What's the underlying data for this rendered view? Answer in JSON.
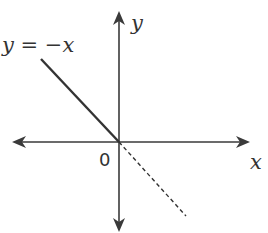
{
  "diagram": {
    "function_label": "y = −x",
    "y_axis_label": "y",
    "x_axis_label": "x",
    "origin_label": "0",
    "colors": {
      "axis": "#3a3a3a",
      "line": "#333333",
      "text": "#333333"
    }
  }
}
